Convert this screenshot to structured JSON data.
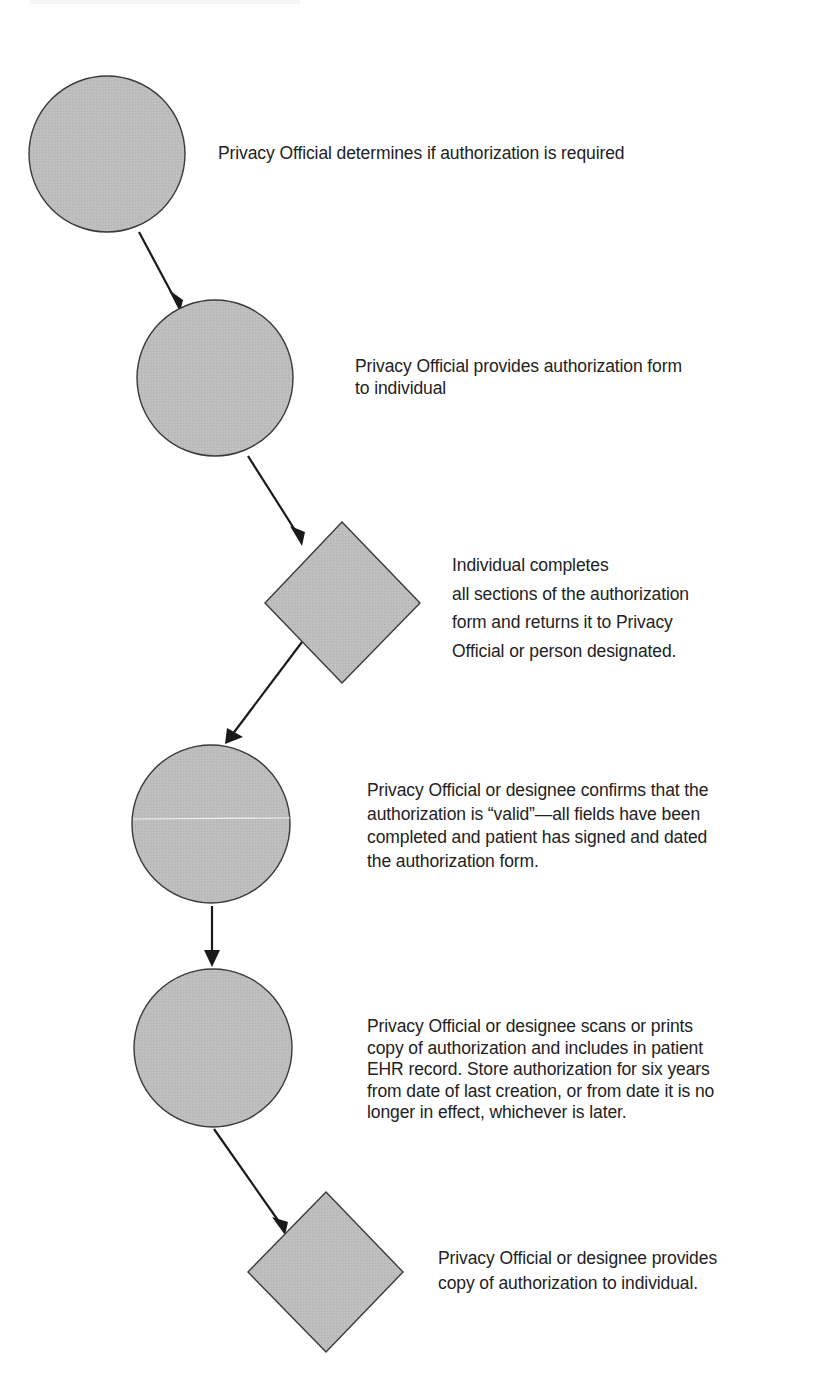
{
  "diagram": {
    "type": "flowchart",
    "colors": {
      "shape_fill": "#bdbdbd",
      "shape_stroke": "#3a3a3a",
      "arrow": "#1a1a1a",
      "text": "#222222",
      "background": "#ffffff"
    },
    "steps": [
      {
        "shape": "circle",
        "lines": [
          "Privacy Official determines if authorization is required"
        ]
      },
      {
        "shape": "circle",
        "lines": [
          "Privacy Official provides authorization form",
          "to individual"
        ]
      },
      {
        "shape": "diamond",
        "lines": [
          "Individual completes",
          "all sections of the authorization",
          "form and returns it to Privacy",
          "Official or person designated."
        ]
      },
      {
        "shape": "circle",
        "lines": [
          "Privacy Official or designee confirms that the",
          "authorization is “valid”—all fields have been",
          "completed and patient has signed and dated",
          "the authorization form."
        ]
      },
      {
        "shape": "circle",
        "lines": [
          "Privacy Official or designee scans or prints",
          "copy of authorization and includes in patient",
          "EHR record. Store authorization for six years",
          "from date of last creation, or from date it is no",
          "longer in effect, whichever is later."
        ]
      },
      {
        "shape": "diamond",
        "lines": [
          "Privacy Official or designee provides",
          "copy of authorization to individual."
        ]
      }
    ],
    "connections": [
      {
        "from": 1,
        "to": 2
      },
      {
        "from": 2,
        "to": 3
      },
      {
        "from": 3,
        "to": 4
      },
      {
        "from": 4,
        "to": 5
      },
      {
        "from": 5,
        "to": 6
      }
    ]
  }
}
